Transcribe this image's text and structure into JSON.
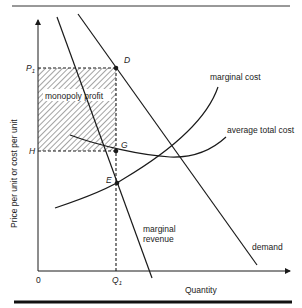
{
  "figure": {
    "y_axis_label": "Price per unit or cost per unit",
    "x_axis_label": "Quantity",
    "origin_label": "0",
    "price_label": "P",
    "price_subscript": "1",
    "cost_label": "H",
    "quantity_label": "Q",
    "quantity_subscript": "1",
    "points": {
      "D": "D",
      "G": "G",
      "E": "E"
    },
    "region_label": "monopoly profit",
    "curves": {
      "marginal_cost": "marginal cost",
      "average_total_cost": "average total cost",
      "marginal_revenue_line1": "marginal",
      "marginal_revenue_line2": "revenue",
      "demand": "demand"
    },
    "colors": {
      "ink": "#1a1a1a",
      "hatch": "#555555",
      "background": "#ffffff"
    }
  }
}
